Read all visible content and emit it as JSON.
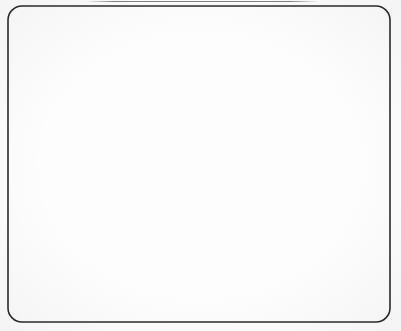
{
  "figure": {
    "title": "",
    "caption": "",
    "domain_type": "diagram",
    "canvas": {
      "width": 401,
      "height": 331,
      "background": "#fdfdfd"
    },
    "border": {
      "name": "rounded-rectangle-frame",
      "x": 8,
      "y": 6,
      "width": 382,
      "height": 316,
      "corner_radius": 14,
      "stroke": "#2b2b2b",
      "stroke_width": 1.6,
      "fill": "none"
    },
    "artifact": {
      "name": "scan-line-artifact",
      "description": "faint cropped caption line at top edge",
      "x": 86,
      "y": 1,
      "width": 232,
      "height": 1
    }
  },
  "chart_data": {
    "type": "scatter",
    "title": "",
    "xlabel": "",
    "ylabel": "",
    "xlim": [
      0,
      401
    ],
    "ylim": [
      0,
      331
    ],
    "grid": false,
    "legend": "none",
    "series": [
      {
        "name": "background-particles",
        "marker": "open-circle",
        "fill": "none",
        "stroke": "#8e8e96",
        "radius": 2.6,
        "stroke_width": 1.0,
        "count_approx": 560,
        "lattice": {
          "pattern": "staggered-hexagonal",
          "dx": 19.0,
          "dy": 12.4,
          "row_offset": 9.5,
          "jitter": 2.6,
          "origin_x": 18,
          "origin_y": 18
        }
      },
      {
        "name": "cluster-disks",
        "marker": "filled-disk",
        "fill": "#808080",
        "stroke": "#6d6d6d",
        "stroke_width": 0.8,
        "texture": "halftone-noise"
      },
      {
        "name": "cluster-nodes-black",
        "marker": "filled-circle",
        "fill": "#0d0d0d",
        "radius": 3.1
      },
      {
        "name": "cluster-nodes-white",
        "marker": "filled-circle",
        "fill": "#ffffff",
        "radius": 3.1
      },
      {
        "name": "cluster-network-edges",
        "marker": "line",
        "stroke": "#3a3a3a",
        "stroke_width": 0.6
      }
    ],
    "clusters": [
      {
        "id": "cluster-top-left",
        "label": "A",
        "cx": 78,
        "cy": 80,
        "r": 38,
        "black_count": 13,
        "white_count": 5,
        "nodes": [
          {
            "x": 70,
            "y": 48,
            "type": "white"
          },
          {
            "x": 91,
            "y": 52,
            "type": "black"
          },
          {
            "x": 56,
            "y": 62,
            "type": "black"
          },
          {
            "x": 79,
            "y": 65,
            "type": "black"
          },
          {
            "x": 102,
            "y": 65,
            "type": "black"
          },
          {
            "x": 46,
            "y": 76,
            "type": "black"
          },
          {
            "x": 67,
            "y": 78,
            "type": "black"
          },
          {
            "x": 113,
            "y": 79,
            "type": "black"
          },
          {
            "x": 91,
            "y": 81,
            "type": "white"
          },
          {
            "x": 55,
            "y": 90,
            "type": "black"
          },
          {
            "x": 75,
            "y": 90,
            "type": "black"
          },
          {
            "x": 100,
            "y": 89,
            "type": "black"
          },
          {
            "x": 44,
            "y": 97,
            "type": "white"
          },
          {
            "x": 63,
            "y": 101,
            "type": "black"
          },
          {
            "x": 86,
            "y": 99,
            "type": "black"
          },
          {
            "x": 72,
            "y": 110,
            "type": "white"
          },
          {
            "x": 95,
            "y": 110,
            "type": "black"
          },
          {
            "x": 58,
            "y": 113,
            "type": "white"
          }
        ],
        "edges": [
          [
            0,
            1
          ],
          [
            1,
            4
          ],
          [
            2,
            3
          ],
          [
            3,
            4
          ],
          [
            5,
            6
          ],
          [
            6,
            3
          ],
          [
            4,
            7
          ],
          [
            7,
            8
          ],
          [
            8,
            11
          ],
          [
            9,
            10
          ],
          [
            10,
            8
          ],
          [
            12,
            13
          ],
          [
            13,
            14
          ],
          [
            14,
            8
          ],
          [
            15,
            16
          ],
          [
            16,
            11
          ],
          [
            17,
            15
          ],
          [
            9,
            6
          ],
          [
            13,
            10
          ],
          [
            15,
            14
          ],
          [
            2,
            5
          ]
        ]
      },
      {
        "id": "cluster-top-right",
        "label": "B",
        "cx": 223,
        "cy": 89,
        "r": 37,
        "black_count": 16,
        "white_count": 4,
        "nodes": [
          {
            "x": 224,
            "y": 57,
            "type": "black"
          },
          {
            "x": 198,
            "y": 68,
            "type": "black"
          },
          {
            "x": 214,
            "y": 72,
            "type": "black"
          },
          {
            "x": 248,
            "y": 72,
            "type": "black"
          },
          {
            "x": 191,
            "y": 82,
            "type": "black"
          },
          {
            "x": 231,
            "y": 81,
            "type": "white"
          },
          {
            "x": 209,
            "y": 86,
            "type": "black"
          },
          {
            "x": 252,
            "y": 88,
            "type": "black"
          },
          {
            "x": 196,
            "y": 96,
            "type": "white"
          },
          {
            "x": 216,
            "y": 97,
            "type": "white"
          },
          {
            "x": 236,
            "y": 94,
            "type": "black"
          },
          {
            "x": 189,
            "y": 99,
            "type": "black"
          },
          {
            "x": 205,
            "y": 107,
            "type": "black"
          },
          {
            "x": 226,
            "y": 108,
            "type": "black"
          },
          {
            "x": 247,
            "y": 104,
            "type": "black"
          },
          {
            "x": 199,
            "y": 114,
            "type": "black"
          },
          {
            "x": 219,
            "y": 117,
            "type": "black"
          },
          {
            "x": 240,
            "y": 116,
            "type": "black"
          },
          {
            "x": 210,
            "y": 124,
            "type": "black"
          },
          {
            "x": 231,
            "y": 124,
            "type": "white"
          }
        ],
        "edges": [
          [
            0,
            2
          ],
          [
            1,
            2
          ],
          [
            2,
            5
          ],
          [
            3,
            5
          ],
          [
            5,
            7
          ],
          [
            4,
            6
          ],
          [
            6,
            9
          ],
          [
            8,
            11
          ],
          [
            9,
            10
          ],
          [
            10,
            14
          ],
          [
            12,
            13
          ],
          [
            13,
            16
          ],
          [
            15,
            18
          ],
          [
            16,
            18
          ],
          [
            17,
            19
          ],
          [
            6,
            12
          ],
          [
            11,
            15
          ],
          [
            13,
            17
          ],
          [
            9,
            13
          ],
          [
            3,
            7
          ],
          [
            0,
            3
          ]
        ]
      },
      {
        "id": "cluster-right",
        "label": "C",
        "cx": 326,
        "cy": 194,
        "r": 38,
        "black_count": 12,
        "white_count": 11,
        "nodes": [
          {
            "x": 306,
            "y": 163,
            "type": "black"
          },
          {
            "x": 344,
            "y": 163,
            "type": "white"
          },
          {
            "x": 296,
            "y": 174,
            "type": "black"
          },
          {
            "x": 317,
            "y": 174,
            "type": "black"
          },
          {
            "x": 337,
            "y": 173,
            "type": "black"
          },
          {
            "x": 357,
            "y": 174,
            "type": "black"
          },
          {
            "x": 288,
            "y": 186,
            "type": "black"
          },
          {
            "x": 309,
            "y": 187,
            "type": "white"
          },
          {
            "x": 330,
            "y": 187,
            "type": "black"
          },
          {
            "x": 351,
            "y": 186,
            "type": "white"
          },
          {
            "x": 364,
            "y": 190,
            "type": "black"
          },
          {
            "x": 291,
            "y": 199,
            "type": "white"
          },
          {
            "x": 312,
            "y": 200,
            "type": "white"
          },
          {
            "x": 333,
            "y": 199,
            "type": "white"
          },
          {
            "x": 354,
            "y": 198,
            "type": "black"
          },
          {
            "x": 288,
            "y": 211,
            "type": "white"
          },
          {
            "x": 303,
            "y": 212,
            "type": "black"
          },
          {
            "x": 322,
            "y": 211,
            "type": "white"
          },
          {
            "x": 343,
            "y": 210,
            "type": "white"
          },
          {
            "x": 358,
            "y": 209,
            "type": "white"
          },
          {
            "x": 311,
            "y": 223,
            "type": "black"
          },
          {
            "x": 332,
            "y": 223,
            "type": "white"
          },
          {
            "x": 348,
            "y": 221,
            "type": "black"
          }
        ],
        "edges": [
          [
            0,
            3
          ],
          [
            1,
            4
          ],
          [
            2,
            3
          ],
          [
            3,
            4
          ],
          [
            4,
            5
          ],
          [
            5,
            10
          ],
          [
            6,
            7
          ],
          [
            7,
            8
          ],
          [
            8,
            9
          ],
          [
            9,
            14
          ],
          [
            11,
            12
          ],
          [
            12,
            13
          ],
          [
            13,
            14
          ],
          [
            15,
            16
          ],
          [
            16,
            17
          ],
          [
            17,
            18
          ],
          [
            18,
            19
          ],
          [
            20,
            21
          ],
          [
            21,
            22
          ],
          [
            2,
            6
          ],
          [
            6,
            11
          ],
          [
            11,
            15
          ],
          [
            7,
            12
          ],
          [
            12,
            17
          ],
          [
            16,
            20
          ],
          [
            8,
            13
          ],
          [
            13,
            18
          ],
          [
            10,
            14
          ],
          [
            0,
            2
          ],
          [
            17,
            21
          ]
        ]
      },
      {
        "id": "cluster-bottom-left",
        "label": "D",
        "cx": 122,
        "cy": 264,
        "r": 37,
        "black_count": 14,
        "white_count": 10,
        "nodes": [
          {
            "x": 110,
            "y": 232,
            "type": "white"
          },
          {
            "x": 131,
            "y": 232,
            "type": "white"
          },
          {
            "x": 100,
            "y": 243,
            "type": "black"
          },
          {
            "x": 121,
            "y": 243,
            "type": "black"
          },
          {
            "x": 144,
            "y": 243,
            "type": "black"
          },
          {
            "x": 90,
            "y": 254,
            "type": "black"
          },
          {
            "x": 111,
            "y": 255,
            "type": "black"
          },
          {
            "x": 133,
            "y": 255,
            "type": "black"
          },
          {
            "x": 152,
            "y": 254,
            "type": "black"
          },
          {
            "x": 87,
            "y": 266,
            "type": "white"
          },
          {
            "x": 103,
            "y": 267,
            "type": "black"
          },
          {
            "x": 124,
            "y": 266,
            "type": "white"
          },
          {
            "x": 145,
            "y": 266,
            "type": "black"
          },
          {
            "x": 157,
            "y": 265,
            "type": "white"
          },
          {
            "x": 89,
            "y": 278,
            "type": "black"
          },
          {
            "x": 109,
            "y": 278,
            "type": "white"
          },
          {
            "x": 131,
            "y": 277,
            "type": "white"
          },
          {
            "x": 152,
            "y": 277,
            "type": "white"
          },
          {
            "x": 96,
            "y": 289,
            "type": "black"
          },
          {
            "x": 117,
            "y": 289,
            "type": "white"
          },
          {
            "x": 138,
            "y": 288,
            "type": "black"
          },
          {
            "x": 149,
            "y": 290,
            "type": "black"
          },
          {
            "x": 108,
            "y": 299,
            "type": "black"
          },
          {
            "x": 129,
            "y": 298,
            "type": "white"
          }
        ],
        "edges": [
          [
            0,
            3
          ],
          [
            1,
            3
          ],
          [
            2,
            3
          ],
          [
            3,
            4
          ],
          [
            5,
            6
          ],
          [
            6,
            7
          ],
          [
            7,
            8
          ],
          [
            9,
            10
          ],
          [
            10,
            11
          ],
          [
            11,
            12
          ],
          [
            12,
            13
          ],
          [
            14,
            15
          ],
          [
            15,
            16
          ],
          [
            16,
            17
          ],
          [
            18,
            19
          ],
          [
            19,
            20
          ],
          [
            20,
            21
          ],
          [
            22,
            23
          ],
          [
            2,
            5
          ],
          [
            5,
            9
          ],
          [
            9,
            14
          ],
          [
            14,
            18
          ],
          [
            6,
            10
          ],
          [
            10,
            15
          ],
          [
            15,
            19
          ],
          [
            18,
            22
          ],
          [
            7,
            11
          ],
          [
            11,
            16
          ],
          [
            16,
            20
          ],
          [
            19,
            23
          ],
          [
            4,
            8
          ],
          [
            8,
            12
          ]
        ]
      }
    ]
  }
}
